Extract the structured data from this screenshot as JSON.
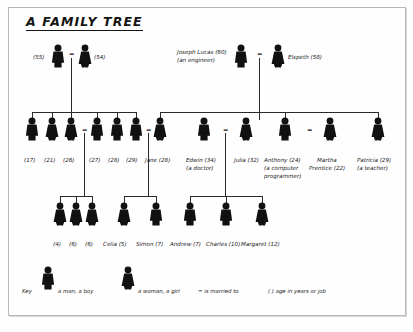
{
  "title": "A FAMILY TREE",
  "generations": {
    "grandparents": [
      {
        "id": "gp1",
        "label": "(55)",
        "name": "",
        "age": "(55)",
        "sex": "man",
        "x": 58,
        "y": 47,
        "labelX": 30,
        "labelY": 56,
        "labelAlign": "right"
      },
      {
        "id": "gp2",
        "label": "(54)",
        "name": "",
        "age": "(54)",
        "sex": "woman",
        "x": 85,
        "y": 47,
        "labelX": 95,
        "labelY": 56,
        "labelAlign": "left"
      },
      {
        "id": "gp3",
        "label": "Joseph Lucas (60)",
        "name": "Joseph Lucas",
        "age": "(60)",
        "job": "(an engineer)",
        "sex": "man",
        "x": 241,
        "y": 47,
        "labelX": 176,
        "labelY": 52,
        "labelAlign": "left"
      },
      {
        "id": "gp4",
        "label": "Elspeth (58)",
        "name": "Elspeth",
        "age": "(58)",
        "sex": "woman",
        "x": 278,
        "y": 47,
        "labelX": 289,
        "labelY": 56,
        "labelAlign": "left"
      }
    ],
    "parents": [
      {
        "id": "p1",
        "label": "(17)",
        "sex": "man",
        "x": 32,
        "y": 120,
        "labelX": 24,
        "labelY": 151
      },
      {
        "id": "p2",
        "label": "(21)",
        "sex": "woman",
        "x": 52,
        "y": 120,
        "labelX": 45,
        "labelY": 151
      },
      {
        "id": "p3",
        "label": "(26)",
        "sex": "woman",
        "x": 71,
        "y": 120,
        "labelX": 64,
        "labelY": 151
      },
      {
        "id": "p4",
        "label": "(27)",
        "sex": "man",
        "x": 97,
        "y": 120,
        "labelX": 89,
        "labelY": 151
      },
      {
        "id": "p5",
        "label": "(28)",
        "sex": "man",
        "x": 117,
        "y": 120,
        "labelX": 109,
        "labelY": 151
      },
      {
        "id": "p6",
        "label": "(29)",
        "sex": "man",
        "x": 136,
        "y": 120,
        "labelX": 128,
        "labelY": 151
      },
      {
        "id": "p7",
        "label": "Jane (28)",
        "sex": "woman",
        "x": 160,
        "y": 120,
        "labelX": 146,
        "labelY": 151
      },
      {
        "id": "p8",
        "label": "Edwin (34)",
        "job": "(a doctor)",
        "sex": "man",
        "x": 204,
        "y": 120,
        "labelX": 188,
        "labelY": 151
      },
      {
        "id": "p9",
        "label": "Julia (32)",
        "sex": "woman",
        "x": 246,
        "y": 120,
        "labelX": 235,
        "labelY": 151
      },
      {
        "id": "p10",
        "label": "Anthony (24)",
        "job": "(a computer",
        "job2": "programmer)",
        "sex": "man",
        "x": 285,
        "y": 120,
        "labelX": 266,
        "labelY": 151
      },
      {
        "id": "p11",
        "label": "Martha",
        "label2": "Prentice (22)",
        "sex": "woman",
        "x": 330,
        "y": 120,
        "labelX": 317,
        "labelY": 151
      },
      {
        "id": "p12",
        "label": "Patricia (29)",
        "job": "(a teacher)",
        "sex": "woman",
        "x": 378,
        "y": 120,
        "labelX": 358,
        "labelY": 151
      }
    ],
    "children": [
      {
        "id": "c1",
        "label": "(4)",
        "sex": "woman",
        "x": 60,
        "y": 205,
        "labelX": 53,
        "labelY": 236
      },
      {
        "id": "c2",
        "label": "(6)",
        "sex": "woman",
        "x": 76,
        "y": 205,
        "labelX": 69,
        "labelY": 236
      },
      {
        "id": "c3",
        "label": "(6)",
        "sex": "woman",
        "x": 92,
        "y": 205,
        "labelX": 85,
        "labelY": 236
      },
      {
        "id": "c4",
        "label": "Celia (5)",
        "sex": "woman",
        "x": 124,
        "y": 205,
        "labelX": 104,
        "labelY": 236
      },
      {
        "id": "c5",
        "label": "Simon (7)",
        "sex": "man",
        "x": 156,
        "y": 205,
        "labelX": 138,
        "labelY": 236
      },
      {
        "id": "c6",
        "label": "Andrew (7)",
        "sex": "man",
        "x": 190,
        "y": 205,
        "labelX": 172,
        "labelY": 236
      },
      {
        "id": "c7",
        "label": "Charles (10)",
        "sex": "man",
        "x": 226,
        "y": 205,
        "labelX": 208,
        "labelY": 236
      },
      {
        "id": "c8",
        "label": "Margaret (12)",
        "sex": "woman",
        "x": 262,
        "y": 205,
        "labelX": 244,
        "labelY": 236
      }
    ]
  },
  "marriages": [
    {
      "id": "m1",
      "symbol": "=",
      "x": 71,
      "y": 55
    },
    {
      "id": "m2",
      "symbol": "=",
      "x": 259,
      "y": 55
    },
    {
      "id": "m3",
      "symbol": "=",
      "x": 84,
      "y": 130
    },
    {
      "id": "m4",
      "symbol": "=",
      "x": 148,
      "y": 130
    },
    {
      "id": "m5",
      "symbol": "=",
      "x": 225,
      "y": 130
    },
    {
      "id": "m6",
      "symbol": "=",
      "x": 309,
      "y": 130
    }
  ],
  "key": {
    "label": "Key",
    "man": "a man, a boy",
    "woman": "a woman, a girl",
    "married": "= is married to",
    "age": "(  ) age in years or job"
  }
}
